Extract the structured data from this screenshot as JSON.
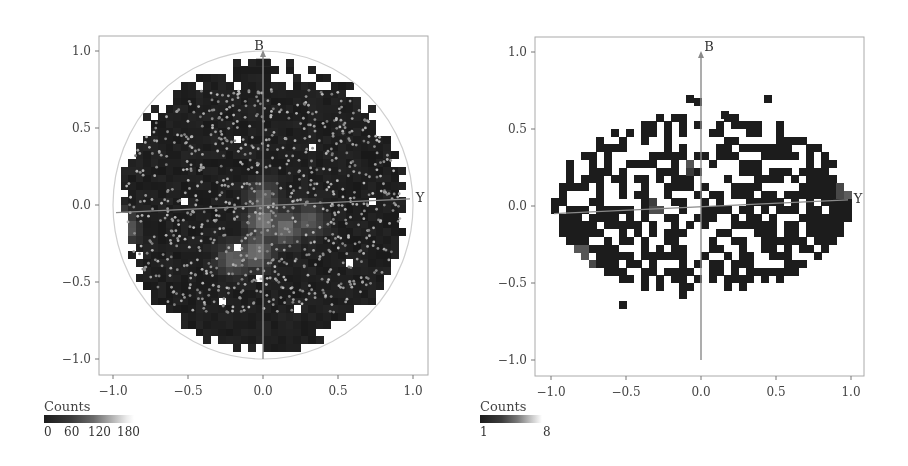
{
  "chart_data": [
    {
      "type": "heatmap",
      "title": "",
      "xlabel": "",
      "ylabel": "",
      "xlim": [
        -1.1,
        1.1
      ],
      "ylim": [
        -1.1,
        1.1
      ],
      "x_ticks": [
        "−1.0",
        "−0.5",
        "0.0",
        "0.5",
        "1.0"
      ],
      "x_tick_values": [
        -1.0,
        -0.5,
        0.0,
        0.5,
        1.0
      ],
      "y_ticks": [
        "1.0",
        "0.5",
        "0.0",
        "−0.5",
        "−1.0"
      ],
      "y_tick_values": [
        1.0,
        0.5,
        0.0,
        -0.5,
        -1.0
      ],
      "grid": false,
      "annotations": [
        {
          "text": "B",
          "x": -0.02,
          "y": 1.06,
          "desc": "arrow along B axis (vertical)"
        },
        {
          "text": "Y",
          "x": 1.03,
          "y": 0.05,
          "desc": "Y axis line, slightly tilted"
        }
      ],
      "unit_circle": true,
      "bin_size": 0.05,
      "colorbar": {
        "title": "Counts",
        "ticks": [
          "0",
          "60",
          "120",
          "180"
        ],
        "tick_values": [
          0,
          60,
          120,
          180
        ],
        "max": 200
      },
      "description": "Dense 2D histogram filling the unit disk (radius ~0.97), mostly low counts (dark) with brighter bins near center (0.0,-0.1) and near left edge (-1.0,-0.15), overlaid with scattered light-gray sample points.",
      "hotspots": [
        {
          "x": 0.0,
          "y": -0.1,
          "value": 110
        },
        {
          "x": -0.05,
          "y": -0.3,
          "value": 100
        },
        {
          "x": 0.15,
          "y": -0.15,
          "value": 95
        },
        {
          "x": -0.98,
          "y": -0.15,
          "value": 170
        },
        {
          "x": -0.2,
          "y": -0.35,
          "value": 80
        },
        {
          "x": 0.3,
          "y": -0.1,
          "value": 70
        },
        {
          "x": 0.0,
          "y": 0.05,
          "value": 75
        }
      ]
    },
    {
      "type": "heatmap",
      "title": "",
      "xlabel": "",
      "ylabel": "",
      "xlim": [
        -1.1,
        1.1
      ],
      "ylim": [
        -1.1,
        1.1
      ],
      "x_ticks": [
        "−1.0",
        "−0.5",
        "0.0",
        "0.5",
        "1.0"
      ],
      "x_tick_values": [
        -1.0,
        -0.5,
        0.0,
        0.5,
        1.0
      ],
      "y_ticks": [
        "1.0",
        "0.5",
        "0.0",
        "−0.5",
        "−1.0"
      ],
      "y_tick_values": [
        1.0,
        0.5,
        0.0,
        -0.5,
        -1.0
      ],
      "grid": false,
      "annotations": [
        {
          "text": "B",
          "x": 0.05,
          "y": 1.02,
          "desc": "arrow along B axis (vertical)"
        },
        {
          "text": "Y",
          "x": 1.04,
          "y": 0.05,
          "desc": "Y axis line, slightly tilted"
        }
      ],
      "unit_circle": false,
      "bin_size": 0.05,
      "colorbar": {
        "title": "Counts",
        "ticks": [
          "1",
          "8"
        ],
        "tick_values": [
          1,
          8
        ],
        "max": 8
      },
      "description": "Sparse 2D histogram within an ellipse (x in [-1,1], y in [-0.65,0.75]), most occupied bins count 1 (black), with a few higher-count bins near (-0.8,-0.3) and (0.95,0.1).",
      "hotspots": [
        {
          "x": -0.8,
          "y": -0.3,
          "value": 4
        },
        {
          "x": -0.75,
          "y": -0.35,
          "value": 3
        },
        {
          "x": 0.97,
          "y": 0.1,
          "value": 4
        },
        {
          "x": -0.3,
          "y": -0.02,
          "value": 3
        },
        {
          "x": -0.08,
          "y": 0.28,
          "value": 3
        }
      ]
    }
  ],
  "panels": [
    {
      "legend_title": "Counts",
      "legend_ticks": [
        "0",
        "60",
        "120",
        "180"
      ],
      "x_tick_labels": [
        "−1.0",
        "−0.5",
        "0.0",
        "0.5",
        "1.0"
      ],
      "y_tick_labels": [
        "1.0",
        "0.5",
        "0.0",
        "−0.5",
        "−1.0"
      ],
      "axis_b_label": "B",
      "axis_y_label": "Y"
    },
    {
      "legend_title": "Counts",
      "legend_ticks": [
        "1",
        "8"
      ],
      "x_tick_labels": [
        "−1.0",
        "−0.5",
        "0.0",
        "0.5",
        "1.0"
      ],
      "y_tick_labels": [
        "1.0",
        "0.5",
        "0.0",
        "−0.5",
        "−1.0"
      ],
      "axis_b_label": "B",
      "axis_y_label": "Y"
    }
  ],
  "colors": {
    "frame": "#999999",
    "axis_line": "#8a8a8a",
    "circle": "#c8c8c8",
    "cell_dark": "#1c1c1c",
    "point": "#9a9a9a"
  }
}
